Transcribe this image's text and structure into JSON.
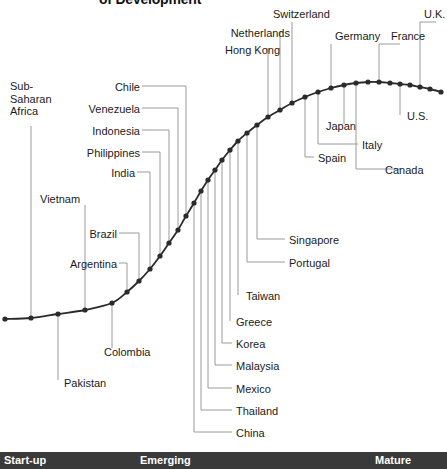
{
  "chart_data": {
    "type": "line",
    "title": "of Development",
    "xlabel": "",
    "ylabel": "",
    "grid": false,
    "legend": null,
    "stages": [
      {
        "label": "Start-up",
        "x_pct": 2
      },
      {
        "label": "Emerging",
        "x_pct": 31
      },
      {
        "label": "Mature",
        "x_pct": 84
      }
    ],
    "x": [
      5,
      31,
      58,
      85,
      112,
      127,
      139,
      150,
      160,
      169,
      178,
      186,
      194,
      201,
      208,
      215,
      222,
      230,
      238,
      247,
      257,
      268,
      280,
      292,
      305,
      318,
      331,
      344,
      356,
      368,
      379,
      390,
      400,
      410,
      420,
      430,
      441
    ],
    "y": [
      319,
      318,
      314,
      310,
      303,
      292,
      281,
      269,
      256,
      243,
      230,
      216,
      203,
      191,
      180,
      170,
      160,
      150,
      141,
      133,
      125,
      117,
      110,
      103,
      97,
      92,
      88,
      85,
      83,
      82,
      82,
      83,
      84,
      85,
      87,
      89,
      92
    ],
    "categories": [
      "Sub-Saharan Africa",
      "Vietnam",
      "Pakistan",
      "Colombia",
      "Argentina",
      "Brazil",
      "India",
      "Philippines",
      "Indonesia",
      "Venezuela",
      "Chile",
      "China",
      "Thailand",
      "Mexico",
      "Malaysia",
      "Korea",
      "Greece",
      "Taiwan",
      "Portugal",
      "Singapore",
      "Hong Kong",
      "Netherlands",
      "Switzerland",
      "Spain",
      "Germany",
      "Japan",
      "Italy",
      "France",
      "Canada",
      "U.S.",
      "U.K."
    ],
    "points": [
      {
        "label": "Sub-Saharan Africa",
        "x": 31,
        "y": 318
      },
      {
        "label": "Vietnam",
        "x": 85,
        "y": 310
      },
      {
        "label": "Pakistan",
        "x": 58,
        "y": 314
      },
      {
        "label": "Colombia",
        "x": 112,
        "y": 303
      },
      {
        "label": "Argentina",
        "x": 127,
        "y": 292
      },
      {
        "label": "Brazil",
        "x": 139,
        "y": 281
      },
      {
        "label": "India",
        "x": 150,
        "y": 269
      },
      {
        "label": "Philippines",
        "x": 160,
        "y": 256
      },
      {
        "label": "Indonesia",
        "x": 169,
        "y": 243
      },
      {
        "label": "Venezuela",
        "x": 178,
        "y": 230
      },
      {
        "label": "Chile",
        "x": 186,
        "y": 216
      },
      {
        "label": "China",
        "x": 194,
        "y": 203
      },
      {
        "label": "Thailand",
        "x": 201,
        "y": 191
      },
      {
        "label": "Mexico",
        "x": 208,
        "y": 180
      },
      {
        "label": "Malaysia",
        "x": 215,
        "y": 170
      },
      {
        "label": "Korea",
        "x": 222,
        "y": 160
      },
      {
        "label": "Greece",
        "x": 230,
        "y": 150
      },
      {
        "label": "Taiwan",
        "x": 238,
        "y": 141
      },
      {
        "label": "Portugal",
        "x": 247,
        "y": 133
      },
      {
        "label": "Singapore",
        "x": 257,
        "y": 125
      },
      {
        "label": "Hong Kong",
        "x": 268,
        "y": 117
      },
      {
        "label": "Netherlands",
        "x": 280,
        "y": 110
      },
      {
        "label": "Switzerland",
        "x": 292,
        "y": 103
      },
      {
        "label": "Spain",
        "x": 305,
        "y": 97
      },
      {
        "label": "Germany",
        "x": 331,
        "y": 88
      },
      {
        "label": "Japan",
        "x": 344,
        "y": 85
      },
      {
        "label": "Italy",
        "x": 318,
        "y": 92
      },
      {
        "label": "France",
        "x": 379,
        "y": 82
      },
      {
        "label": "Canada",
        "x": 356,
        "y": 83
      },
      {
        "label": "U.S.",
        "x": 400,
        "y": 84
      },
      {
        "label": "U.K.",
        "x": 420,
        "y": 87
      }
    ]
  },
  "labels": {
    "title": "of Development",
    "sub_saharan_africa_l1": "Sub-",
    "sub_saharan_africa_l2": "Saharan",
    "sub_saharan_africa_l3": "Africa",
    "vietnam": "Vietnam",
    "pakistan": "Pakistan",
    "colombia": "Colombia",
    "argentina": "Argentina",
    "brazil": "Brazil",
    "india": "India",
    "philippines": "Philippines",
    "indonesia": "Indonesia",
    "venezuela": "Venezuela",
    "chile": "Chile",
    "china": "China",
    "thailand": "Thailand",
    "mexico": "Mexico",
    "malaysia": "Malaysia",
    "korea": "Korea",
    "greece": "Greece",
    "taiwan": "Taiwan",
    "portugal": "Portugal",
    "singapore": "Singapore",
    "hong_kong": "Hong Kong",
    "netherlands": "Netherlands",
    "switzerland": "Switzerland",
    "spain": "Spain",
    "germany": "Germany",
    "japan": "Japan",
    "italy": "Italy",
    "france": "France",
    "canada": "Canada",
    "us": "U.S.",
    "uk": "U.K."
  },
  "stage_bar": {
    "startup": "Start-up",
    "emerging": "Emerging",
    "mature": "Mature"
  },
  "colors": {
    "curve": "#2b2b2b",
    "leader": "#9a9a9a",
    "text": "#1b1b1b",
    "stage_bar_bg": "#3a3a3a",
    "stage_bar_text": "#ffffff",
    "background": "#ffffff"
  }
}
